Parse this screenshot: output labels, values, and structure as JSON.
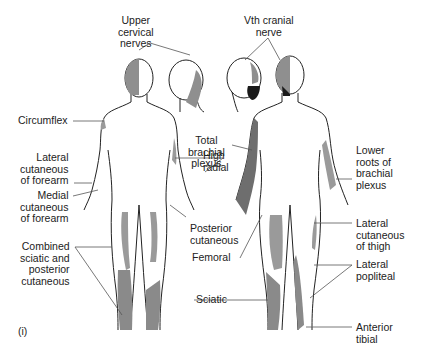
{
  "figure": {
    "panel_label": "(i)",
    "colors": {
      "outline": "#222222",
      "light_shade": "#9a9a9a",
      "dark_shade": "#6e6e6e",
      "black_shade": "#1a1a1a",
      "leader_line": "#555555"
    },
    "labels": {
      "upper_cervical": "Upper\ncervical\nnerves",
      "vth_cranial": "Vth cranial\nnerve",
      "circumflex": "Circumflex",
      "lateral_cutaneous_forearm": "Lateral\ncutaneous\nof forearm",
      "medial_cutaneous_forearm": "Medial\ncutaneous\nof forearm",
      "combined_sciatic": "Combined\nsciatic and\nposterior\ncutaneous",
      "total_brachial": "Total\nbrachial\nplexus",
      "high_radial": "High\nradial",
      "posterior_cutaneous": "Posterior\ncutaneous",
      "femoral": "Femoral",
      "sciatic": "Sciatic",
      "lower_roots": "Lower\nroots of\nbrachial\nplexus",
      "lateral_cutaneous_thigh": "Lateral\ncutaneous\nof thigh",
      "lateral_popliteal": "Lateral\npopliteal",
      "anterior_tibial": "Anterior\ntibial"
    }
  }
}
